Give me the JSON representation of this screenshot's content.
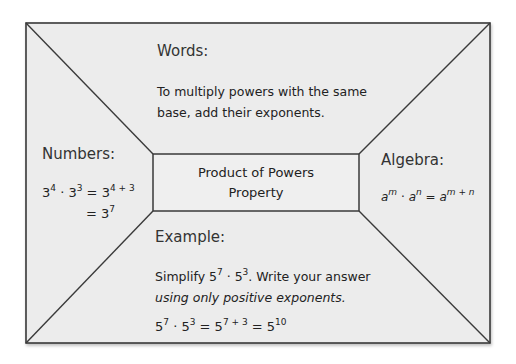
{
  "diagram": {
    "center": {
      "line1": "Product of Powers",
      "line2": "Property"
    },
    "words": {
      "label": "Words:",
      "line1": "To multiply powers with the same",
      "line2": "base, add their exponents."
    },
    "numbers": {
      "label": "Numbers:",
      "eq1_base1": "3",
      "eq1_exp1": "4",
      "dot": "·",
      "eq1_base2": "3",
      "eq1_exp2": "3",
      "eq1_eq": "=",
      "eq1_base3": "3",
      "eq1_exp3": "4 + 3",
      "eq2_eq": "=",
      "eq2_base": "3",
      "eq2_exp": "7"
    },
    "algebra": {
      "label": "Algebra:",
      "a1": "a",
      "m1": "m",
      "dot": "·",
      "a2": "a",
      "n1": "n",
      "eq": "=",
      "a3": "a",
      "mn": "m + n"
    },
    "example": {
      "label": "Example:",
      "line1_pre": "Simplify 5",
      "line1_exp1": "7",
      "line1_mid": " · 5",
      "line1_exp2": "3",
      "line1_post": ". Write your answer",
      "line2": "using only positive exponents.",
      "sol_b1": "5",
      "sol_e1": "7",
      "sol_dot": " · ",
      "sol_b2": "5",
      "sol_e2": "3",
      "sol_eq1": " = ",
      "sol_b3": "5",
      "sol_e3": "7 + 3",
      "sol_eq2": " = ",
      "sol_b4": "5",
      "sol_e4": "10"
    },
    "colors": {
      "background": "#ececec",
      "border": "#3a3a3a",
      "text": "#222222"
    }
  }
}
